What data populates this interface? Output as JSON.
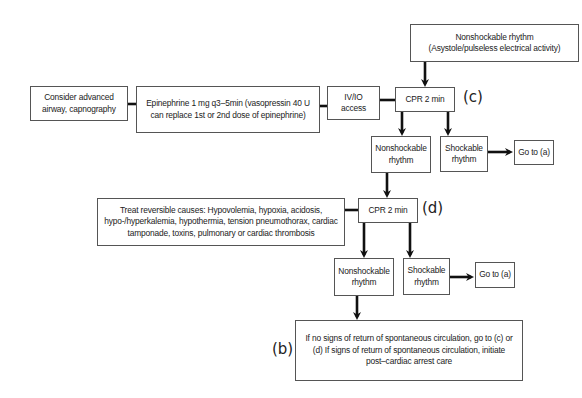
{
  "diagram": {
    "nodes": {
      "start": {
        "line1": "Nonshockable rhythm",
        "line2": "(Asystole/pulseless electrical activity)"
      },
      "cpr_c": {
        "text": "CPR 2 min"
      },
      "iv_io": {
        "line1": "IV/IO",
        "line2": "access"
      },
      "epinephrine": {
        "text": "Epinephrine 1 mg q3–5min (vasopressin 40 U can replace 1st or 2nd dose of epinephrine)"
      },
      "airway": {
        "line1": "Consider advanced",
        "line2": "airway, capnography"
      },
      "nonshock_1": {
        "line1": "Nonshockable",
        "line2": "rhythm"
      },
      "shock_1": {
        "line1": "Shockable",
        "line2": "rhythm"
      },
      "goto_a_1": {
        "text": "Go to (a)"
      },
      "cpr_d": {
        "text": "CPR 2 min"
      },
      "treat": {
        "text": "Treat reversible causes: Hypovolemia, hypoxia, acidosis, hypo-/hyperkalemia, hypothermia, tension pneumothorax, cardiac tamponade, toxins, pulmonary or cardiac thrombosis"
      },
      "nonshock_2": {
        "line1": "Nonshockable",
        "line2": "rhythm"
      },
      "shock_2": {
        "line1": "Shockable",
        "line2": "rhythm"
      },
      "goto_a_2": {
        "text": "Go to (a)"
      },
      "final": {
        "text": "If no signs of return of spontaneous circulation, go to (c) or (d) If signs of return of spontaneous circulation, initiate post–cardiac arrest care"
      }
    },
    "labels": {
      "c": "(c)",
      "d": "(d)",
      "b": "(b)"
    },
    "colors": {
      "line": "#111111",
      "border": "#555555",
      "text": "#222222"
    }
  }
}
